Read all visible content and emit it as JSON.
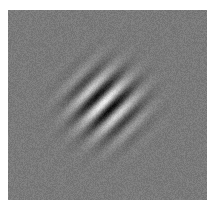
{
  "image": {
    "description": "Gabor patch stimulus embedded in gray noise",
    "background_gray": "#7a7a7a",
    "page_background": "#ffffff",
    "gabor": {
      "center_x": 97,
      "center_y": 93,
      "orientation_deg": 45,
      "wavelength_px": 19,
      "sigma_px": 22,
      "contrast": 0.9,
      "phase": 0.6
    },
    "noise_amplitude": 10
  }
}
